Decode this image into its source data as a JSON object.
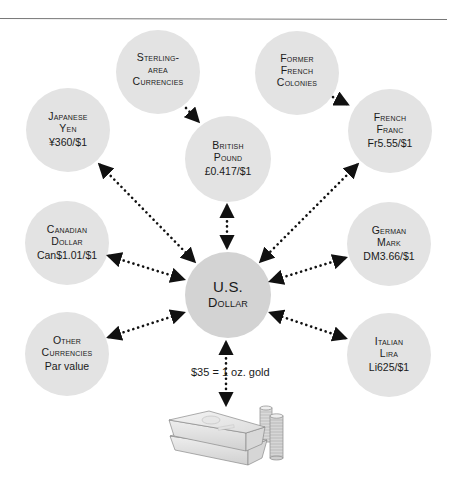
{
  "diagram": {
    "colors": {
      "node_fill": "#e3e3e3",
      "center_fill": "#d3d3d3",
      "arrow": "#111111",
      "rule": "#777777"
    },
    "center": {
      "id": "usd",
      "line1": "U.S.",
      "line2": "Dollar"
    },
    "nodes": [
      {
        "id": "sterling_area",
        "line1": "Sterling-",
        "line2": "area",
        "line3": "Currencies",
        "rate": ""
      },
      {
        "id": "former_french",
        "line1": "Former",
        "line2": "French",
        "line3": "Colonies",
        "rate": ""
      },
      {
        "id": "japanese_yen",
        "line1": "Japanese",
        "line2": "Yen",
        "rate": "¥360/$1"
      },
      {
        "id": "british_pound",
        "line1": "British",
        "line2": "Pound",
        "rate": "£0.417/$1"
      },
      {
        "id": "french_franc",
        "line1": "French",
        "line2": "Franc",
        "rate": "Fr5.55/$1"
      },
      {
        "id": "canadian_dollar",
        "line1": "Canadian",
        "line2": "Dollar",
        "rate": "Can$1.01/$1"
      },
      {
        "id": "german_mark",
        "line1": "German",
        "line2": "Mark",
        "rate": "DM3.66/$1"
      },
      {
        "id": "other_currencies",
        "line1": "Other",
        "line2": "Currencies",
        "rate": "Par value"
      },
      {
        "id": "italian_lira",
        "line1": "Italian",
        "line2": "Lira",
        "rate": "Li625/$1"
      }
    ],
    "edges": [
      {
        "from": "sterling_area",
        "to": "british_pound",
        "type": "one-way"
      },
      {
        "from": "former_french",
        "to": "french_franc",
        "type": "one-way"
      },
      {
        "from": "japanese_yen",
        "to": "usd",
        "type": "two-way"
      },
      {
        "from": "british_pound",
        "to": "usd",
        "type": "two-way"
      },
      {
        "from": "french_franc",
        "to": "usd",
        "type": "two-way"
      },
      {
        "from": "canadian_dollar",
        "to": "usd",
        "type": "two-way"
      },
      {
        "from": "german_mark",
        "to": "usd",
        "type": "two-way"
      },
      {
        "from": "other_currencies",
        "to": "usd",
        "type": "two-way"
      },
      {
        "from": "italian_lira",
        "to": "usd",
        "type": "two-way"
      },
      {
        "from": "usd",
        "to": "gold",
        "type": "two-way"
      }
    ],
    "gold": {
      "label": "$35 = 1 oz. gold",
      "icon": "gold-bars-and-coins-icon"
    }
  }
}
